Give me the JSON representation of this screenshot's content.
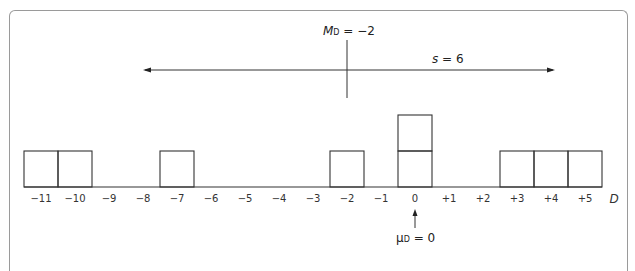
{
  "figure": {
    "axis_variable": "D",
    "tick_labels": [
      "−11",
      "−10",
      "−9",
      "−8",
      "−7",
      "−6",
      "−5",
      "−4",
      "−3",
      "−2",
      "−1",
      "0",
      "+1",
      "+2",
      "+3",
      "+4",
      "+5"
    ],
    "mean_label": {
      "symbol": "M",
      "subscript": "D",
      "text": " = −2"
    },
    "sd_label": {
      "symbol": "s",
      "text": " = 6"
    },
    "pop_mean_label": {
      "symbol": "μ",
      "subscript": "D",
      "text": " = 0"
    }
  },
  "chart_data": {
    "type": "histogram",
    "title": "",
    "xlabel": "D",
    "ylabel": "",
    "x": [
      -11,
      -10,
      -9,
      -8,
      -7,
      -6,
      -5,
      -4,
      -3,
      -2,
      -1,
      0,
      1,
      2,
      3,
      4,
      5
    ],
    "frequencies": [
      1,
      1,
      0,
      0,
      1,
      0,
      0,
      0,
      0,
      1,
      0,
      2,
      0,
      0,
      1,
      1,
      1
    ],
    "scores": [
      -11,
      -10,
      -7,
      -2,
      0,
      0,
      3,
      4,
      5
    ],
    "annotations": [
      {
        "label": "M_D = −2",
        "type": "vertical-marker",
        "x": -2
      },
      {
        "label": "s = 6",
        "type": "double-arrow",
        "from": -8,
        "to": 4
      },
      {
        "label": "μ_D = 0",
        "type": "up-arrow",
        "x": 0
      }
    ],
    "grid": false
  }
}
